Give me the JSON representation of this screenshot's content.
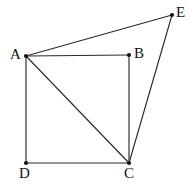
{
  "figure": {
    "canvas": {
      "width": 191,
      "height": 191,
      "background": "#ffffff"
    },
    "style": {
      "edge_color": "#2b2b2b",
      "vertex_color": "#151515",
      "label_color": "#111111",
      "edge_width": 1.15,
      "vertex_radius": 2.1,
      "label_font_size": 15
    },
    "vertices": [
      {
        "id": "A",
        "label": "A",
        "x": 26,
        "y": 56,
        "label_x": 10,
        "label_y": 47,
        "dot": true
      },
      {
        "id": "B",
        "label": "B",
        "x": 129,
        "y": 55,
        "label_x": 134,
        "label_y": 46,
        "dot": true
      },
      {
        "id": "C",
        "label": "C",
        "x": 129,
        "y": 163,
        "label_x": 124,
        "label_y": 166,
        "dot": true
      },
      {
        "id": "D",
        "label": "D",
        "x": 26,
        "y": 163,
        "label_x": 19,
        "label_y": 166,
        "dot": true
      },
      {
        "id": "E",
        "label": "E",
        "x": 172,
        "y": 15,
        "label_x": 176,
        "label_y": 5,
        "dot": true
      }
    ],
    "edges": [
      {
        "id": "AB",
        "from": "A",
        "to": "B"
      },
      {
        "id": "AD",
        "from": "A",
        "to": "D"
      },
      {
        "id": "AC",
        "from": "A",
        "to": "C"
      },
      {
        "id": "AE",
        "from": "A",
        "to": "E"
      },
      {
        "id": "BC",
        "from": "B",
        "to": "C"
      },
      {
        "id": "DC",
        "from": "D",
        "to": "C"
      },
      {
        "id": "EC",
        "from": "E",
        "to": "C"
      }
    ]
  }
}
